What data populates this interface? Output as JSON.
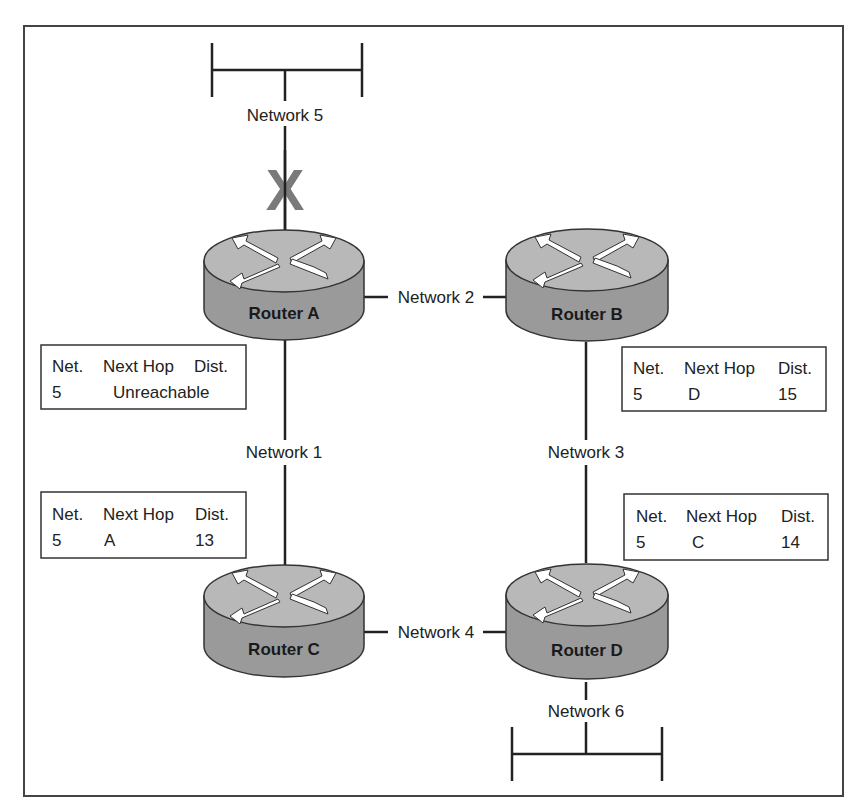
{
  "diagram": {
    "routers": [
      {
        "id": "A",
        "label": "Router A"
      },
      {
        "id": "B",
        "label": "Router B"
      },
      {
        "id": "C",
        "label": "Router C"
      },
      {
        "id": "D",
        "label": "Router D"
      }
    ],
    "networks": [
      {
        "id": 1,
        "label": "Network 1"
      },
      {
        "id": 2,
        "label": "Network 2"
      },
      {
        "id": 3,
        "label": "Network 3"
      },
      {
        "id": 4,
        "label": "Network 4"
      },
      {
        "id": 5,
        "label": "Network 5"
      },
      {
        "id": 6,
        "label": "Network 6"
      }
    ],
    "failure_marker": {
      "symbol": "X",
      "network": "Network 5",
      "color": "#7a7a7a"
    },
    "routing_tables": {
      "A": {
        "headers": [
          "Net.",
          "Next Hop",
          "Dist."
        ],
        "row": {
          "net": "5",
          "next_hop": "Unreachable",
          "dist": ""
        }
      },
      "B": {
        "headers": [
          "Net.",
          "Next Hop",
          "Dist."
        ],
        "row": {
          "net": "5",
          "next_hop": "D",
          "dist": "15"
        }
      },
      "C": {
        "headers": [
          "Net.",
          "Next Hop",
          "Dist."
        ],
        "row": {
          "net": "5",
          "next_hop": "A",
          "dist": "13"
        }
      },
      "D": {
        "headers": [
          "Net.",
          "Next Hop",
          "Dist."
        ],
        "row": {
          "net": "5",
          "next_hop": "C",
          "dist": "14"
        }
      }
    },
    "colors": {
      "router_top": "#b8b8b8",
      "router_body": "#9a9a9a",
      "line": "#222222"
    }
  }
}
